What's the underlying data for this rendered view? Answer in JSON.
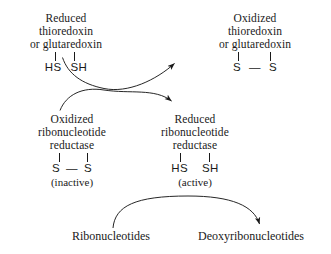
{
  "diagram": {
    "background_color": "#ffffff",
    "ink_color": "#1a1a1a",
    "nodes": {
      "reduced_thioredoxin": {
        "line1": "Reduced",
        "line2": "thioredoxin",
        "line3": "or glutaredoxin",
        "atoms_left": "HS",
        "atoms_right": "SH",
        "state": ""
      },
      "oxidized_thioredoxin": {
        "line1": "Oxidized",
        "line2": "thioredoxin",
        "line3": "or glutaredoxin",
        "atoms_left": "S",
        "bond": "—",
        "atoms_right": "S",
        "state": ""
      },
      "oxidized_reductase": {
        "line1": "Oxidized",
        "line2": "ribonucleotide",
        "line3": "reductase",
        "atoms_left": "S",
        "bond": "—",
        "atoms_right": "S",
        "state": "(inactive)"
      },
      "reduced_reductase": {
        "line1": "Reduced",
        "line2": "ribonucleotide",
        "line3": "reductase",
        "atoms_left": "HS",
        "atoms_right": "SH",
        "state": "(active)"
      }
    },
    "substrates": {
      "start": "Ribonucleotides",
      "product": "Deoxyribonucleotides"
    },
    "arrows": [
      {
        "name": "reduced-thioredoxin-to-oxidized-thioredoxin",
        "from": "reduced_thioredoxin",
        "to": "oxidized_thioredoxin"
      },
      {
        "name": "oxidized-reductase-to-reduced-reductase",
        "from": "oxidized_reductase",
        "to": "reduced_reductase"
      },
      {
        "name": "ribonucleotides-to-deoxyribonucleotides",
        "from": "start",
        "to": "product"
      }
    ]
  }
}
